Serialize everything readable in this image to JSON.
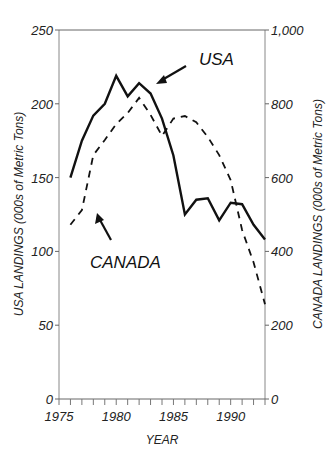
{
  "chart_data": {
    "type": "line",
    "title": "",
    "xlabel": "YEAR",
    "ylabel": "USA LANDINGS (000s of Metric Tons)",
    "y2label": "CANADA LANDINGS (000s of Metric Tons)",
    "xlim": [
      1975,
      1993
    ],
    "ylim": [
      0,
      250
    ],
    "y2lim": [
      0,
      1000
    ],
    "x_ticks": [
      "1975",
      "1980",
      "1985",
      "1990"
    ],
    "y_ticks": [
      "0",
      "50",
      "100",
      "150",
      "200",
      "250"
    ],
    "y2_ticks": [
      "0",
      "200",
      "400",
      "600",
      "800",
      "1,000"
    ],
    "grid": false,
    "legend": "inline annotations with arrows",
    "x": [
      1976,
      1977,
      1978,
      1979,
      1980,
      1981,
      1982,
      1983,
      1984,
      1985,
      1986,
      1987,
      1988,
      1989,
      1990,
      1991,
      1992,
      1993
    ],
    "series": [
      {
        "name": "USA",
        "axis": "left",
        "style": "solid",
        "values": [
          150,
          175,
          192,
          200,
          219,
          205,
          214,
          207,
          190,
          165,
          125,
          135,
          136,
          121,
          133,
          132,
          118,
          108
        ]
      },
      {
        "name": "CANADA",
        "axis": "right",
        "style": "dashed",
        "values": [
          472,
          512,
          661,
          702,
          745,
          775,
          816,
          770,
          713,
          760,
          767,
          750,
          710,
          661,
          593,
          458,
          370,
          257
        ]
      }
    ],
    "annotations": [
      "USA",
      "CANADA"
    ]
  },
  "labels": {
    "usa": "USA",
    "canada": "CANADA"
  }
}
